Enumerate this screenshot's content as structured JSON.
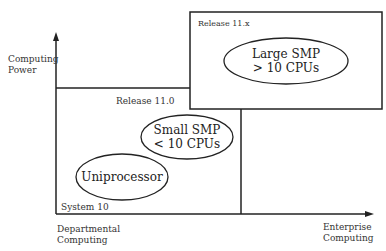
{
  "axes": {
    "y_label_line1": "Computing",
    "y_label_line2": "Power",
    "x_left_label_line1": "Departmental",
    "x_left_label_line2": "Computing",
    "x_right_label_line1": "Enterprise",
    "x_right_label_line2": "Computing"
  },
  "regions": [
    {
      "label": "System 10"
    },
    {
      "label": "Release 11.0"
    },
    {
      "label": "Release 11.x"
    }
  ],
  "ellipses": [
    {
      "line1": "Uniprocessor",
      "line2": ""
    },
    {
      "line1": "Small SMP",
      "line2": "< 10 CPUs"
    },
    {
      "line1": "Large SMP",
      "line2": "> 10 CPUs"
    }
  ]
}
